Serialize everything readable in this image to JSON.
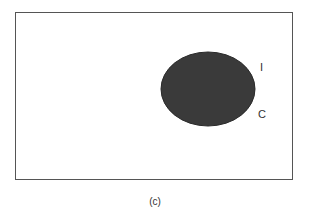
{
  "diagram": {
    "universe_label": "",
    "set_labels": {
      "inner": "I",
      "complement": "C"
    },
    "ellipse_fill": "#3a3a3a",
    "frame_color": "#555555",
    "caption": "(c)"
  }
}
